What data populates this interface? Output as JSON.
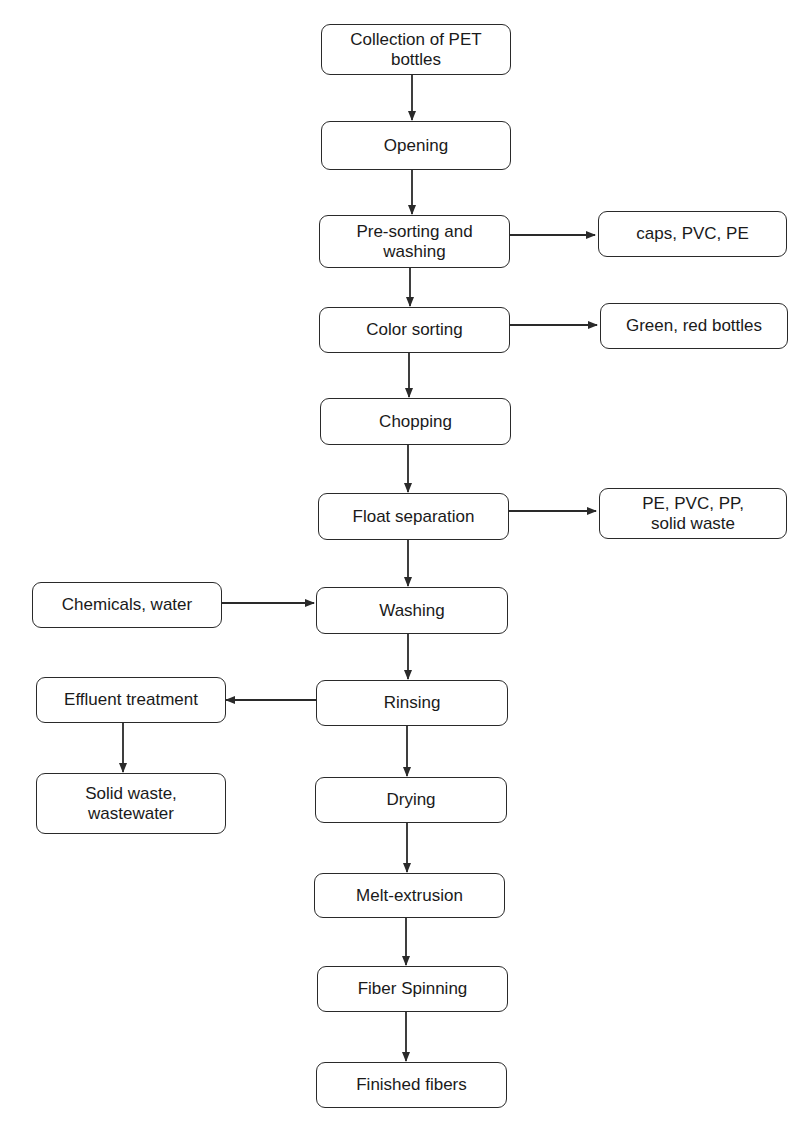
{
  "diagram": {
    "type": "flowchart",
    "title": "",
    "main_steps": [
      {
        "id": "collection",
        "label": "Collection of PET bottles"
      },
      {
        "id": "opening",
        "label": "Opening"
      },
      {
        "id": "presorting",
        "label": "Pre-sorting and washing"
      },
      {
        "id": "color",
        "label": "Color sorting"
      },
      {
        "id": "chopping",
        "label": "Chopping"
      },
      {
        "id": "float",
        "label": "Float separation"
      },
      {
        "id": "washing",
        "label": "Washing"
      },
      {
        "id": "rinsing",
        "label": "Rinsing"
      },
      {
        "id": "drying",
        "label": "Drying"
      },
      {
        "id": "melt",
        "label": "Melt-extrusion"
      },
      {
        "id": "spinning",
        "label": "Fiber Spinning"
      },
      {
        "id": "finished",
        "label": "Finished fibers"
      }
    ],
    "side_nodes": [
      {
        "id": "caps",
        "label": "caps, PVC, PE"
      },
      {
        "id": "green",
        "label": "Green, red bottles"
      },
      {
        "id": "pepvc",
        "label": "PE, PVC, PP, solid waste"
      },
      {
        "id": "chemicals",
        "label": "Chemicals, water"
      },
      {
        "id": "effluent",
        "label": "Effluent treatment"
      },
      {
        "id": "solidwaste",
        "label": "Solid waste, wastewater"
      }
    ],
    "edges": [
      {
        "from": "collection",
        "to": "opening"
      },
      {
        "from": "opening",
        "to": "presorting"
      },
      {
        "from": "presorting",
        "to": "color"
      },
      {
        "from": "presorting",
        "to": "caps"
      },
      {
        "from": "color",
        "to": "chopping"
      },
      {
        "from": "color",
        "to": "green"
      },
      {
        "from": "chopping",
        "to": "float"
      },
      {
        "from": "float",
        "to": "washing"
      },
      {
        "from": "float",
        "to": "pepvc"
      },
      {
        "from": "chemicals",
        "to": "washing"
      },
      {
        "from": "washing",
        "to": "rinsing"
      },
      {
        "from": "rinsing",
        "to": "effluent"
      },
      {
        "from": "effluent",
        "to": "solidwaste"
      },
      {
        "from": "rinsing",
        "to": "drying"
      },
      {
        "from": "drying",
        "to": "melt"
      },
      {
        "from": "melt",
        "to": "spinning"
      },
      {
        "from": "spinning",
        "to": "finished"
      }
    ],
    "line_color": "#2a2a2a"
  }
}
